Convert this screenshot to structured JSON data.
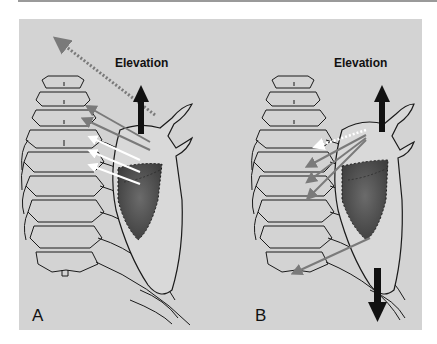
{
  "figure": {
    "panels": [
      {
        "id": "A",
        "letter": "A",
        "motion_label": "Elevation",
        "description": "Scapula with upward elevation arrow, dotted arrow toward upper-left, gray and white arrows toward cervical/thoracic spine"
      },
      {
        "id": "B",
        "letter": "B",
        "motion_label": "Elevation",
        "description": "Scapula with upward elevation arrow and downward depression arrow, gray arrows toward thoracic spine, white dotted arrow"
      }
    ],
    "colors": {
      "background": "#d3d3d3",
      "line": "#1a1a1a",
      "muscle_fill": "#4a4a4a",
      "gray_arrow": "#7a7a7a",
      "white_arrow": "#ffffff",
      "black_arrow": "#111111"
    }
  }
}
